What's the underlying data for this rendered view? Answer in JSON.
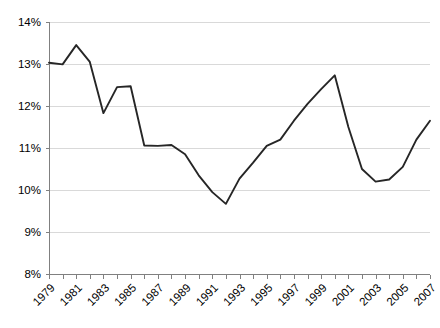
{
  "chart_data": {
    "type": "line",
    "title": "",
    "subtitle": "",
    "xlabel": "",
    "ylabel": "",
    "x": [
      1979,
      1980,
      1981,
      1982,
      1983,
      1984,
      1985,
      1986,
      1987,
      1988,
      1989,
      1990,
      1991,
      1992,
      1993,
      1994,
      1995,
      1996,
      1997,
      1998,
      1999,
      2000,
      2001,
      2002,
      2003,
      2004,
      2005,
      2006,
      2007
    ],
    "values": [
      13.03,
      12.99,
      13.45,
      13.05,
      11.83,
      12.45,
      12.47,
      11.06,
      11.05,
      11.07,
      10.85,
      10.35,
      9.95,
      9.67,
      10.27,
      10.65,
      11.05,
      11.2,
      11.65,
      12.05,
      12.4,
      12.73,
      11.5,
      10.5,
      10.2,
      10.25,
      10.55,
      11.2,
      11.65
    ],
    "series": [
      {
        "name": "",
        "values": [
          13.03,
          12.99,
          13.45,
          13.05,
          11.83,
          12.45,
          12.47,
          11.06,
          11.05,
          11.07,
          10.85,
          10.35,
          9.95,
          9.67,
          10.27,
          10.65,
          11.05,
          11.2,
          11.65,
          12.05,
          12.4,
          12.73,
          11.5,
          10.5,
          10.2,
          10.25,
          10.55,
          11.2,
          11.65
        ],
        "color": "#262626"
      }
    ],
    "xlim": [
      1979,
      2007
    ],
    "ylim": [
      8,
      14
    ],
    "grid": true,
    "grid_axis": "y",
    "legend": false,
    "legend_position": "none",
    "y_ticks": [
      8,
      9,
      10,
      11,
      12,
      13,
      14
    ],
    "y_tick_labels": [
      "8%",
      "9%",
      "10%",
      "11%",
      "12%",
      "13%",
      "14%"
    ],
    "x_ticks": [
      1979,
      1980,
      1981,
      1982,
      1983,
      1984,
      1985,
      1986,
      1987,
      1988,
      1989,
      1990,
      1991,
      1992,
      1993,
      1994,
      1995,
      1996,
      1997,
      1998,
      1999,
      2000,
      2001,
      2002,
      2003,
      2004,
      2005,
      2006,
      2007
    ],
    "x_tick_labels_shown": [
      "1979",
      "1981",
      "1983",
      "1985",
      "1987",
      "1989",
      "1991",
      "1993",
      "1995",
      "1997",
      "1999",
      "2001",
      "2003",
      "2005",
      "2007"
    ],
    "x_tick_label_rotation": -45,
    "annotations": [],
    "colors": {
      "line": "#262626",
      "grid": "#d9d9d9",
      "axis": "#808080",
      "text": "#000000",
      "background": "#ffffff"
    }
  }
}
